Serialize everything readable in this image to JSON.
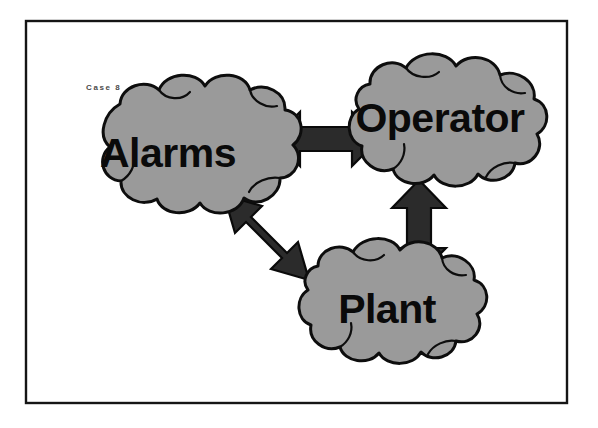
{
  "page": {
    "background_color": "#ffffff",
    "width": 598,
    "height": 428
  },
  "frame": {
    "name": "slide-border",
    "stroke_color": "#151515"
  },
  "annotation": {
    "case_label": "Case 8"
  },
  "style": {
    "cloud_fill": "#9a9a9a",
    "cloud_stroke": "#0d0d0d",
    "arrow_fill": "#2b2b2b",
    "arrow_stroke": "#0a0a0a",
    "label_color": "#0a0a0a"
  },
  "diagram": {
    "type": "cloud-node-relationship-diagram",
    "nodes": [
      {
        "id": "alarms",
        "label": "Alarms",
        "shape": "cloud",
        "center_x": 168,
        "center_y": 155
      },
      {
        "id": "operator",
        "label": "Operator",
        "shape": "cloud",
        "center_x": 438,
        "center_y": 120
      },
      {
        "id": "plant",
        "label": "Plant",
        "shape": "cloud",
        "center_x": 384,
        "center_y": 311
      }
    ],
    "edges": [
      {
        "id": "alarms-operator",
        "from": "alarms",
        "to": "operator",
        "style": "double-headed-arrow",
        "orientation": "horizontal"
      },
      {
        "id": "operator-plant",
        "from": "operator",
        "to": "plant",
        "style": "double-headed-arrow",
        "orientation": "vertical"
      },
      {
        "id": "alarms-plant",
        "from": "alarms",
        "to": "plant",
        "style": "double-headed-arrow",
        "orientation": "diagonal"
      }
    ]
  }
}
